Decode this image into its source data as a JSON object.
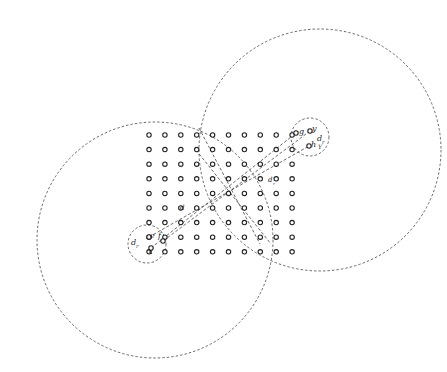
{
  "diagram": {
    "grid": {
      "cols": 10,
      "rows": 9,
      "origin_x": 149,
      "origin_y": 135,
      "pitch_x": 15.9,
      "pitch_y": 14.6,
      "point_radius": 2.2
    },
    "large_circles": [
      {
        "name": "left-large-circle",
        "cx": 155,
        "cy": 240,
        "r": 118
      },
      {
        "name": "right-large-circle",
        "cx": 320,
        "cy": 150,
        "r": 121
      }
    ],
    "small_circles": [
      {
        "name": "top-right-small-circle",
        "cx": 310,
        "cy": 137,
        "r": 19
      },
      {
        "name": "bottom-left-small-circle",
        "cx": 147,
        "cy": 244,
        "r": 19
      }
    ],
    "extra_points": [
      {
        "name": "point-g",
        "x": 296,
        "y": 133
      },
      {
        "name": "point-y",
        "x": 310,
        "y": 131
      },
      {
        "name": "point-h",
        "x": 309,
        "y": 146
      },
      {
        "name": "point-e",
        "x": 149,
        "y": 237
      },
      {
        "name": "point-x",
        "x": 151,
        "y": 248
      },
      {
        "name": "point-f",
        "x": 163,
        "y": 241
      }
    ],
    "lines": [
      {
        "name": "line-x-to-g",
        "x1": 151,
        "y1": 248,
        "x2": 296,
        "y2": 133
      },
      {
        "name": "line-e-to-h",
        "x1": 149,
        "y1": 237,
        "x2": 309,
        "y2": 146
      },
      {
        "name": "line-y-to-f",
        "x1": 310,
        "y1": 131,
        "x2": 163,
        "y2": 241
      },
      {
        "name": "line-cross-1",
        "x1": 199,
        "y1": 128,
        "x2": 260,
        "y2": 244
      },
      {
        "name": "line-cross-2",
        "x1": 196,
        "y1": 150,
        "x2": 271,
        "y2": 244
      }
    ],
    "labels": [
      {
        "name": "label-g",
        "text": "g",
        "x": 299,
        "y": 134,
        "size": 8
      },
      {
        "name": "label-y",
        "text": "y",
        "x": 312,
        "y": 131,
        "size": 8
      },
      {
        "name": "label-h",
        "text": "h",
        "x": 311,
        "y": 147,
        "size": 8
      },
      {
        "name": "label-d-top",
        "text": "d",
        "x": 317,
        "y": 141,
        "size": 8
      },
      {
        "name": "label-d-top-sub",
        "text": "r",
        "x": 322,
        "y": 144,
        "size": 5
      },
      {
        "name": "label-y-top-2",
        "text": "Y",
        "x": 318,
        "y": 149,
        "size": 6
      },
      {
        "name": "label-e",
        "text": "e",
        "x": 150,
        "y": 238,
        "size": 8
      },
      {
        "name": "label-f",
        "text": "f",
        "x": 158,
        "y": 238,
        "size": 8
      },
      {
        "name": "label-x",
        "text": "x",
        "x": 148,
        "y": 254,
        "size": 8
      },
      {
        "name": "label-d-bottom",
        "text": "d",
        "x": 131,
        "y": 245,
        "size": 8
      },
      {
        "name": "label-d-bottom-sub",
        "text": "r",
        "x": 136,
        "y": 248,
        "size": 5
      },
      {
        "name": "label-d-mid",
        "text": "d",
        "x": 180,
        "y": 210,
        "size": 7
      },
      {
        "name": "label-d-mid-2",
        "text": "d",
        "x": 268,
        "y": 182,
        "size": 7
      },
      {
        "name": "label-d-mid-2-sub",
        "text": "r",
        "x": 273,
        "y": 185,
        "size": 4
      }
    ]
  }
}
